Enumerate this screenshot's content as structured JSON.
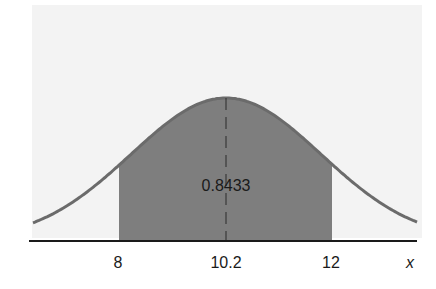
{
  "chart_data": {
    "type": "area",
    "title": "",
    "mean": 10.2,
    "shaded_interval": [
      8,
      12
    ],
    "shaded_area_label": "0.8433",
    "xlabel": "x",
    "ylabel": "",
    "x_ticks": [
      "8",
      "10.2",
      "12"
    ],
    "grid": false,
    "legend": null
  },
  "colors": {
    "panel_bg": "#f3f3f3",
    "curve": "#6b6b6b",
    "shade": "#7e7e7e",
    "axis": "#1a1a1a"
  }
}
